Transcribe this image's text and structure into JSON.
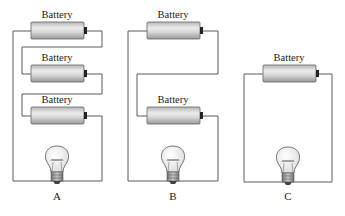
{
  "diagram": {
    "type": "circuit-comparison",
    "component_label": "Battery",
    "circuits": [
      {
        "id": "A",
        "caption": "A",
        "batteries": 3,
        "arrangement": "three batteries in series",
        "load": "light bulb"
      },
      {
        "id": "B",
        "caption": "B",
        "batteries": 2,
        "arrangement": "two batteries in series",
        "load": "light bulb"
      },
      {
        "id": "C",
        "caption": "C",
        "batteries": 1,
        "arrangement": "single battery",
        "load": "light bulb"
      }
    ],
    "labels": {
      "a1": "Battery",
      "a2": "Battery",
      "a3": "Battery",
      "b1": "Battery",
      "b2": "Battery",
      "c1": "Battery",
      "capA": "A",
      "capB": "B",
      "capC": "C"
    },
    "colors": {
      "wire": "#5a5a5a",
      "battery_light": "#e6e6e6",
      "battery_dark": "#a8a8a8",
      "terminal": "#222222",
      "bulb_glass": "#f4f4f4",
      "bulb_base": "#8c8c8c"
    }
  }
}
